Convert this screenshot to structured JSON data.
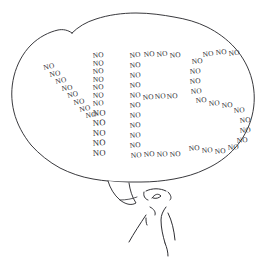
{
  "image": {
    "kind": "hand-drawn-cartoon",
    "title": "Speech bubble spelling YES out of the word NO",
    "background_color": "#ffffff",
    "ink_color": "#2e2e33",
    "width": 273,
    "height": 264
  },
  "speech_bubble": {
    "label": "speech bubble",
    "outline_color": "#2e2e33",
    "fill_color": "#ffffff",
    "tail_direction": "down"
  },
  "figure": {
    "label": "stick figure person",
    "ink_color": "#2e2e33"
  },
  "message": {
    "spelled_word": "YES",
    "repeated_word": "NO",
    "letters": [
      {
        "letter": "Y",
        "word_count": 18,
        "words": [
          {
            "text": "NO",
            "x": 44,
            "y": 70,
            "rot": -12
          },
          {
            "text": "NO",
            "x": 50,
            "y": 77,
            "rot": -10
          },
          {
            "text": "NO",
            "x": 56,
            "y": 84,
            "rot": -12
          },
          {
            "text": "NO",
            "x": 62,
            "y": 91,
            "rot": -8
          },
          {
            "text": "NO",
            "x": 68,
            "y": 98,
            "rot": -14
          },
          {
            "text": "NO",
            "x": 74,
            "y": 105,
            "rot": -10
          },
          {
            "text": "NO",
            "x": 80,
            "y": 112,
            "rot": -12
          },
          {
            "text": "NO",
            "x": 86,
            "y": 118,
            "rot": -8
          },
          {
            "text": "NO",
            "x": 93,
            "y": 58,
            "rot": -6
          },
          {
            "text": "NO",
            "x": 93,
            "y": 66,
            "rot": -4
          },
          {
            "text": "NO",
            "x": 93,
            "y": 74,
            "rot": -6
          },
          {
            "text": "NO",
            "x": 93,
            "y": 82,
            "rot": -3
          },
          {
            "text": "NO",
            "x": 93,
            "y": 90,
            "rot": -6
          },
          {
            "text": "NO",
            "x": 93,
            "y": 98,
            "rot": -4
          },
          {
            "text": "NO",
            "x": 93,
            "y": 106,
            "rot": -5
          },
          {
            "text": "NO",
            "x": 93,
            "y": 116,
            "rot": -3
          },
          {
            "text": "NO",
            "x": 93,
            "y": 126,
            "rot": -4
          },
          {
            "text": "NO",
            "x": 93,
            "y": 136,
            "rot": -3
          },
          {
            "text": "NO",
            "x": 93,
            "y": 146,
            "rot": -4
          },
          {
            "text": "NO",
            "x": 93,
            "y": 156,
            "rot": -3
          }
        ]
      },
      {
        "letter": "E",
        "word_count": 20,
        "words": [
          {
            "text": "NO",
            "x": 130,
            "y": 58,
            "rot": -8
          },
          {
            "text": "NO",
            "x": 144,
            "y": 57,
            "rot": -6
          },
          {
            "text": "NO",
            "x": 157,
            "y": 57,
            "rot": -8
          },
          {
            "text": "NO",
            "x": 170,
            "y": 58,
            "rot": -6
          },
          {
            "text": "NO",
            "x": 130,
            "y": 68,
            "rot": -6
          },
          {
            "text": "NO",
            "x": 130,
            "y": 78,
            "rot": -5
          },
          {
            "text": "NO",
            "x": 130,
            "y": 88,
            "rot": -6
          },
          {
            "text": "NO",
            "x": 130,
            "y": 98,
            "rot": -5
          },
          {
            "text": "NO",
            "x": 130,
            "y": 108,
            "rot": -6
          },
          {
            "text": "NO",
            "x": 143,
            "y": 100,
            "rot": -6
          },
          {
            "text": "NO",
            "x": 155,
            "y": 99,
            "rot": -5
          },
          {
            "text": "NO",
            "x": 167,
            "y": 99,
            "rot": -6
          },
          {
            "text": "NO",
            "x": 130,
            "y": 118,
            "rot": -5
          },
          {
            "text": "NO",
            "x": 130,
            "y": 128,
            "rot": -6
          },
          {
            "text": "NO",
            "x": 130,
            "y": 138,
            "rot": -5
          },
          {
            "text": "NO",
            "x": 130,
            "y": 148,
            "rot": -6
          },
          {
            "text": "NO",
            "x": 131,
            "y": 158,
            "rot": -5
          },
          {
            "text": "NO",
            "x": 144,
            "y": 157,
            "rot": -6
          },
          {
            "text": "NO",
            "x": 157,
            "y": 157,
            "rot": -5
          },
          {
            "text": "NO",
            "x": 170,
            "y": 157,
            "rot": -6
          }
        ]
      },
      {
        "letter": "S",
        "word_count": 18,
        "words": [
          {
            "text": "NO",
            "x": 203,
            "y": 57,
            "rot": -8
          },
          {
            "text": "NO",
            "x": 216,
            "y": 55,
            "rot": -6
          },
          {
            "text": "NO",
            "x": 229,
            "y": 56,
            "rot": -8
          },
          {
            "text": "NO",
            "x": 192,
            "y": 64,
            "rot": -6
          },
          {
            "text": "NO",
            "x": 190,
            "y": 74,
            "rot": -5
          },
          {
            "text": "NO",
            "x": 190,
            "y": 84,
            "rot": -6
          },
          {
            "text": "NO",
            "x": 191,
            "y": 94,
            "rot": -5
          },
          {
            "text": "NO",
            "x": 196,
            "y": 103,
            "rot": -6
          },
          {
            "text": "NO",
            "x": 209,
            "y": 106,
            "rot": -5
          },
          {
            "text": "NO",
            "x": 222,
            "y": 108,
            "rot": -6
          },
          {
            "text": "NO",
            "x": 234,
            "y": 113,
            "rot": -5
          },
          {
            "text": "NO",
            "x": 240,
            "y": 123,
            "rot": -6
          },
          {
            "text": "NO",
            "x": 240,
            "y": 133,
            "rot": -5
          },
          {
            "text": "NO",
            "x": 237,
            "y": 143,
            "rot": -6
          },
          {
            "text": "NO",
            "x": 228,
            "y": 150,
            "rot": -5
          },
          {
            "text": "NO",
            "x": 215,
            "y": 154,
            "rot": -6
          },
          {
            "text": "NO",
            "x": 202,
            "y": 153,
            "rot": -5
          },
          {
            "text": "NO",
            "x": 189,
            "y": 151,
            "rot": -6
          }
        ]
      }
    ]
  }
}
